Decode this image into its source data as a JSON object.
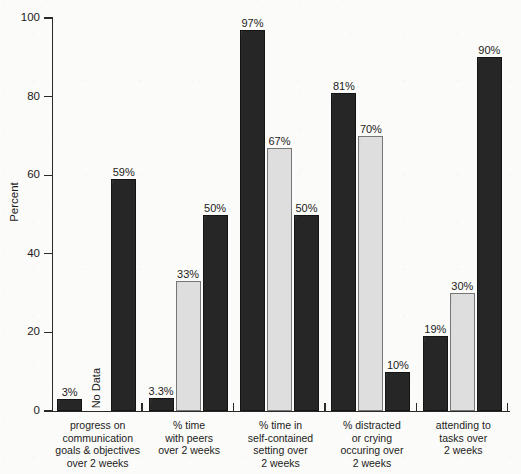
{
  "chart_data": {
    "type": "bar",
    "title": "",
    "subtitle": "",
    "xlabel": "",
    "ylabel": "Percent",
    "ylim": [
      0,
      100
    ],
    "yticks": [
      0,
      20,
      40,
      60,
      80,
      100
    ],
    "ytick_labels": [
      "0",
      "20",
      "40",
      "60",
      "80",
      "100"
    ],
    "grid": false,
    "legend": "none",
    "categories": [
      "progress on communication goals & objectives over 2 weeks",
      "% time with peers over 2 weeks",
      "% time in self-contained setting over 2 weeks",
      "% distracted or crying occuring over 2 weeks",
      "attending to tasks over 2 weeks"
    ],
    "category_label_lines": [
      [
        "progress on",
        "communication",
        "goals & objectives",
        "over 2 weeks"
      ],
      [
        "% time",
        "with peers",
        "over 2 weeks"
      ],
      [
        "% time in",
        "self-contained",
        "setting over",
        "2 weeks"
      ],
      [
        "% distracted",
        "or crying",
        "occuring over",
        "2 weeks"
      ],
      [
        "attending to",
        "tasks over",
        "2 weeks"
      ]
    ],
    "series": [
      {
        "name": "series-1",
        "style": "dark",
        "values": [
          3,
          3.3,
          97,
          81,
          19
        ],
        "labels": [
          "3%",
          "3.3%",
          "97%",
          "81%",
          "19%"
        ]
      },
      {
        "name": "series-2",
        "style": "light",
        "values": [
          null,
          33,
          67,
          70,
          30
        ],
        "labels": [
          "No Data",
          "33%",
          "67%",
          "70%",
          "30%"
        ]
      },
      {
        "name": "series-3",
        "style": "dark",
        "values": [
          59,
          50,
          50,
          10,
          90
        ],
        "labels": [
          "59%",
          "50%",
          "50%",
          "10%",
          "90%"
        ]
      }
    ],
    "annotations": [
      {
        "text": "No Data",
        "group": 0,
        "series": 1
      }
    ],
    "colors": {
      "dark_bar": "#262626",
      "light_bar": "#dedede",
      "axis": "#2a2a2a",
      "text": "#1b1b1b",
      "background": "#fbfbf9"
    }
  },
  "axis": {
    "y_title": "Percent"
  }
}
